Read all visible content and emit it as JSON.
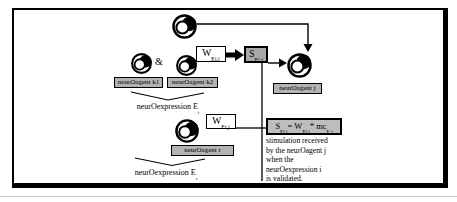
{
  "figure": {
    "ampersand": "&",
    "agents": {
      "k1": {
        "label": "neurOagent k1"
      },
      "k2": {
        "label": "neurOagent k2"
      },
      "j": {
        "label": "neurOagent j"
      },
      "r": {
        "label": "neurOagent r"
      }
    },
    "weight_ei": {
      "base": "W",
      "sub": "Ei,j"
    },
    "weight_er": {
      "base": "W",
      "sub": "Er,j"
    },
    "stimulus": {
      "base": "S",
      "sub": "Ei,j"
    },
    "expression_i": {
      "text": "neurOexpression E",
      "sub": "i"
    },
    "expression_r": {
      "text": "neurOexpression E",
      "sub": "r"
    },
    "formula": {
      "s_base": "S",
      "s_sub": "Ei,j",
      "mid": "= W",
      "w_sub": "Ei,j",
      "mult": "* mc",
      "mc_sub": "E i"
    },
    "caption_lines": [
      "stimulation received",
      "by the neurOagent j",
      "when the",
      "neurOexpression i",
      "is validated."
    ],
    "colors": {
      "line": "#000000",
      "gray_fill": "#b3b3b3",
      "stimulus_fill": "#a8a8a8",
      "formula_fill": "#bdbdbd"
    }
  }
}
